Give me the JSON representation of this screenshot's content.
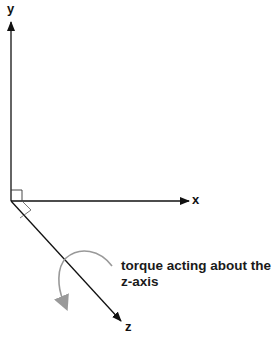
{
  "diagram": {
    "type": "3d-coordinate-axes",
    "axes": {
      "x": {
        "label": "x"
      },
      "y": {
        "label": "y"
      },
      "z": {
        "label": "z"
      }
    },
    "annotation": {
      "line1": "torque acting about the",
      "line2": "z-axis"
    },
    "colors": {
      "axis": "#111111",
      "torque_arrow": "#999999",
      "text": "#1a1a1a",
      "background": "#ffffff"
    }
  }
}
